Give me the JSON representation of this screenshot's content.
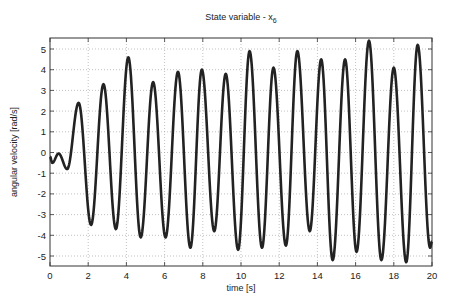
{
  "chart_data": {
    "type": "line",
    "title": "State variable - x",
    "title_subscript": "6",
    "xlabel": "time [s]",
    "ylabel": "angular velocity [rad/s]",
    "xlim": [
      0,
      20
    ],
    "ylim": [
      -5.5,
      5.5
    ],
    "xticks": [
      0,
      2,
      4,
      6,
      8,
      10,
      12,
      14,
      16,
      18,
      20
    ],
    "yticks": [
      -5,
      -4,
      -3,
      -2,
      -1,
      0,
      1,
      2,
      3,
      4,
      5
    ],
    "grid": true,
    "legend": null,
    "line_color": "#222222",
    "series": [
      {
        "name": "x6",
        "extrema": [
          [
            0.0,
            -0.2
          ],
          [
            0.12,
            -0.5
          ],
          [
            0.45,
            -0.05
          ],
          [
            0.9,
            -0.8
          ],
          [
            1.5,
            2.4
          ],
          [
            2.15,
            -3.5
          ],
          [
            2.8,
            3.3
          ],
          [
            3.45,
            -3.7
          ],
          [
            4.1,
            4.6
          ],
          [
            4.75,
            -4.1
          ],
          [
            5.4,
            3.4
          ],
          [
            6.05,
            -4.1
          ],
          [
            6.7,
            3.9
          ],
          [
            7.35,
            -4.6
          ],
          [
            7.95,
            4.0
          ],
          [
            8.6,
            -3.8
          ],
          [
            9.2,
            3.8
          ],
          [
            9.85,
            -4.7
          ],
          [
            10.45,
            4.9
          ],
          [
            11.1,
            -4.6
          ],
          [
            11.7,
            4.1
          ],
          [
            12.35,
            -4.5
          ],
          [
            12.95,
            4.9
          ],
          [
            13.6,
            -3.8
          ],
          [
            14.2,
            4.5
          ],
          [
            14.8,
            -5.2
          ],
          [
            15.45,
            4.5
          ],
          [
            16.05,
            -4.8
          ],
          [
            16.7,
            5.4
          ],
          [
            17.35,
            -5.2
          ],
          [
            18.0,
            4.1
          ],
          [
            18.65,
            -5.3
          ],
          [
            19.25,
            5.2
          ],
          [
            19.9,
            -4.6
          ],
          [
            20.0,
            -4.3
          ]
        ]
      }
    ]
  },
  "labels": {
    "title_main": "State variable - x",
    "title_sub": "6",
    "xlabel": "time [s]",
    "ylabel": "angular velocity [rad/s]",
    "xtick_labels": [
      "0",
      "2",
      "4",
      "6",
      "8",
      "10",
      "12",
      "14",
      "16",
      "18",
      "20"
    ],
    "ytick_labels": [
      "-5",
      "-4",
      "-3",
      "-2",
      "-1",
      "0",
      "1",
      "2",
      "3",
      "4",
      "5"
    ]
  }
}
